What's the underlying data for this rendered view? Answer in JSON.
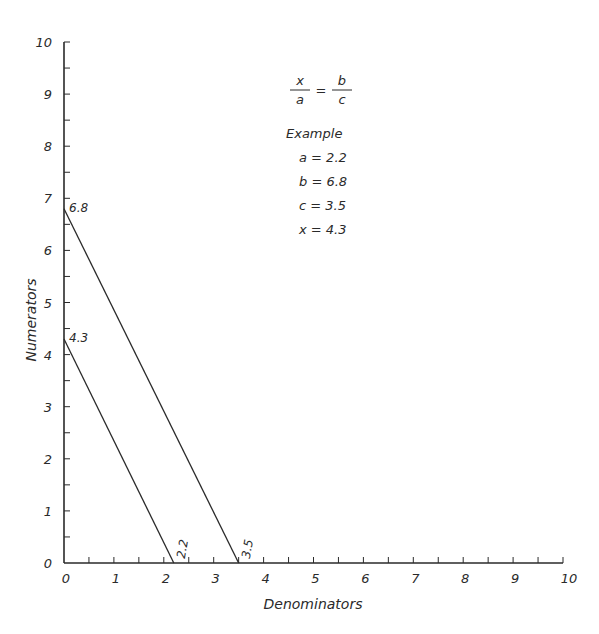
{
  "chart_data": {
    "type": "line",
    "title": "",
    "xlabel": "Denominators",
    "ylabel": "Numerators",
    "xlim": [
      0,
      10
    ],
    "ylim": [
      0,
      10
    ],
    "x_ticks": [
      0,
      1,
      2,
      3,
      4,
      5,
      6,
      7,
      8,
      9,
      10
    ],
    "y_ticks": [
      0,
      1,
      2,
      3,
      4,
      5,
      6,
      7,
      8,
      9,
      10
    ],
    "minor_tick_step": 0.5,
    "grid": false,
    "series": [
      {
        "name": "b-c line",
        "points": [
          [
            0,
            6.8
          ],
          [
            3.5,
            0
          ]
        ],
        "labels": [
          "6.8",
          "3.5"
        ]
      },
      {
        "name": "x-a line",
        "points": [
          [
            0,
            4.3
          ],
          [
            2.2,
            0
          ]
        ],
        "labels": [
          "4.3",
          "2.2"
        ]
      }
    ],
    "annotations": {
      "formula": {
        "lhs_num": "x",
        "lhs_den": "a",
        "eq": "=",
        "rhs_num": "b",
        "rhs_den": "c"
      },
      "example_title": "Example",
      "example_lines": [
        "a = 2.2",
        "b = 6.8",
        "c = 3.5",
        "x = 4.3"
      ]
    },
    "colors": {
      "ink": "#2a2a2a",
      "background": "#ffffff"
    }
  }
}
